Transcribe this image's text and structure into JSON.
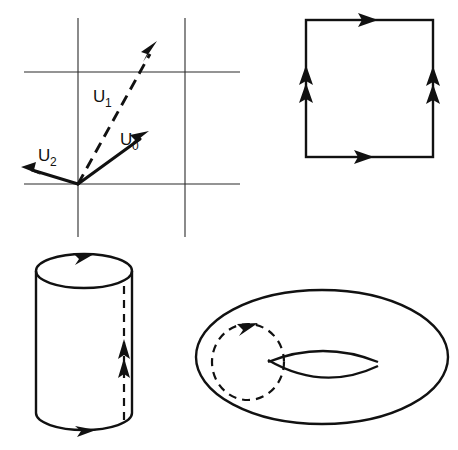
{
  "figure": {
    "title": "",
    "background_color": "#ffffff",
    "ink_color": "#111111",
    "width": 458,
    "height": 450,
    "panels": [
      {
        "id": "vector-basis-panel",
        "name": "vector-basis-diagram",
        "description": "Cartesian grid with three labelled vectors from a common origin"
      },
      {
        "id": "square-panel",
        "name": "square-identification-diagram",
        "description": "Square with edge identification arrows"
      },
      {
        "id": "cylinder-panel",
        "name": "cylinder-diagram",
        "description": "Cylinder with directed top rim, bottom rim and dashed seam"
      },
      {
        "id": "torus-panel",
        "name": "torus-diagram",
        "description": "Torus with dashed meridian circle carrying an arrow"
      }
    ]
  },
  "vector_panel": {
    "origin": {
      "x": 78,
      "y": 184
    },
    "grid": {
      "vertical_lines_x": [
        78,
        185
      ],
      "horizontal_lines_y": [
        72,
        184
      ],
      "vertical_extent_y": [
        18,
        237
      ],
      "horizontal_extent_x": [
        24,
        240
      ]
    },
    "vectors": [
      {
        "name": "U0",
        "label_base": "U",
        "label_sub": "0",
        "style": "solid",
        "tip": {
          "x": 147,
          "y": 133
        },
        "label_pos": {
          "x": 120,
          "y": 145
        }
      },
      {
        "name": "U1",
        "label_base": "U",
        "label_sub": "1",
        "style": "dashed",
        "tip": {
          "x": 157,
          "y": 44
        },
        "label_pos": {
          "x": 93,
          "y": 102
        }
      },
      {
        "name": "U2",
        "label_base": "U",
        "label_sub": "2",
        "style": "solid",
        "tip": {
          "x": 23,
          "y": 168
        },
        "label_pos": {
          "x": 38,
          "y": 161
        }
      }
    ]
  },
  "square_panel": {
    "bounds": {
      "left": 306,
      "top": 20,
      "right": 433,
      "bottom": 157
    },
    "edges": [
      {
        "name": "top-edge",
        "direction": "right",
        "arrow_count": 1
      },
      {
        "name": "bottom-edge",
        "direction": "right",
        "arrow_count": 1
      },
      {
        "name": "left-edge",
        "direction": "up",
        "arrow_count": 2
      },
      {
        "name": "right-edge",
        "direction": "up",
        "arrow_count": 2
      }
    ]
  },
  "cylinder_panel": {
    "top_ellipse": {
      "cx": 84,
      "cy": 271,
      "rx": 48,
      "ry": 17
    },
    "bottom_arc": {
      "cx": 84,
      "cy": 413,
      "rx": 48,
      "ry": 17
    },
    "side_left_x": 36,
    "side_right_x": 132,
    "seam": {
      "x": 124,
      "y_top": 286,
      "y_bottom": 420,
      "style": "dashed",
      "arrow_count": 2,
      "direction": "up"
    },
    "top_rim_arrow": {
      "direction": "right",
      "arrow_count": 1
    },
    "bottom_rim_arrow": {
      "direction": "right",
      "arrow_count": 1
    }
  },
  "torus_panel": {
    "outer_ellipse": {
      "cx": 322,
      "cy": 357,
      "rx": 126,
      "ry": 67
    },
    "hole": {
      "cx": 323,
      "cy": 363,
      "rx": 55,
      "ry": 16
    },
    "meridian": {
      "cx": 248,
      "cy": 362,
      "rx": 36,
      "ry": 38,
      "style": "dashed",
      "arrow_count": 1,
      "direction": "right"
    }
  }
}
